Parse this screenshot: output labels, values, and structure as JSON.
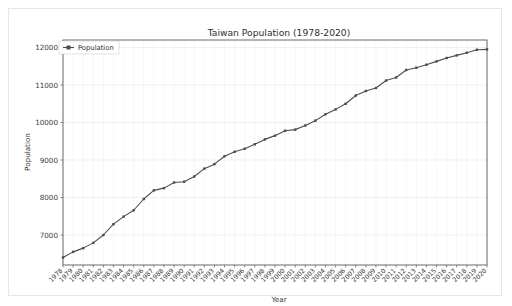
{
  "figure": {
    "background_color": "#ffffff",
    "frame_color": "#e6e6e6",
    "accent_color": "#4d4d4d",
    "grid_color": "#e9eaf0"
  },
  "legend": {
    "entries": [
      "Population"
    ],
    "position": "upper-left"
  },
  "chart_data": {
    "type": "line",
    "title": "Taiwan Population (1978-2020)",
    "xlabel": "Year",
    "ylabel": "Population",
    "legend": [
      "Population"
    ],
    "grid": true,
    "ylim": [
      6200,
      12200
    ],
    "yticks": [
      7000,
      8000,
      9000,
      10000,
      11000,
      12000
    ],
    "ytick_labels": [
      "7000",
      "8000",
      "9000",
      "10000",
      "11000",
      "12000"
    ],
    "categories": [
      "1978",
      "1979",
      "1980",
      "1981",
      "1982",
      "1983",
      "1984",
      "1985",
      "1986",
      "1987",
      "1988",
      "1989",
      "1990",
      "1991",
      "1992",
      "1993",
      "1994",
      "1995",
      "1996",
      "1997",
      "1998",
      "1999",
      "2000",
      "2001",
      "2002",
      "2003",
      "2004",
      "2005",
      "2006",
      "2007",
      "2008",
      "2009",
      "2010",
      "2011",
      "2012",
      "2013",
      "2014",
      "2015",
      "2016",
      "2017",
      "2018",
      "2019",
      "2020"
    ],
    "series": [
      {
        "name": "Population",
        "values": [
          6400,
          6550,
          6650,
          6790,
          7000,
          7290,
          7490,
          7660,
          7960,
          8190,
          8250,
          8400,
          8420,
          8560,
          8770,
          8890,
          9100,
          9220,
          9300,
          9420,
          9550,
          9650,
          9780,
          9810,
          9920,
          10050,
          10220,
          10350,
          10500,
          10720,
          10840,
          10920,
          11120,
          11200,
          11400,
          11460,
          11540,
          11630,
          11720,
          11790,
          11860,
          11940,
          11950
        ]
      }
    ]
  }
}
